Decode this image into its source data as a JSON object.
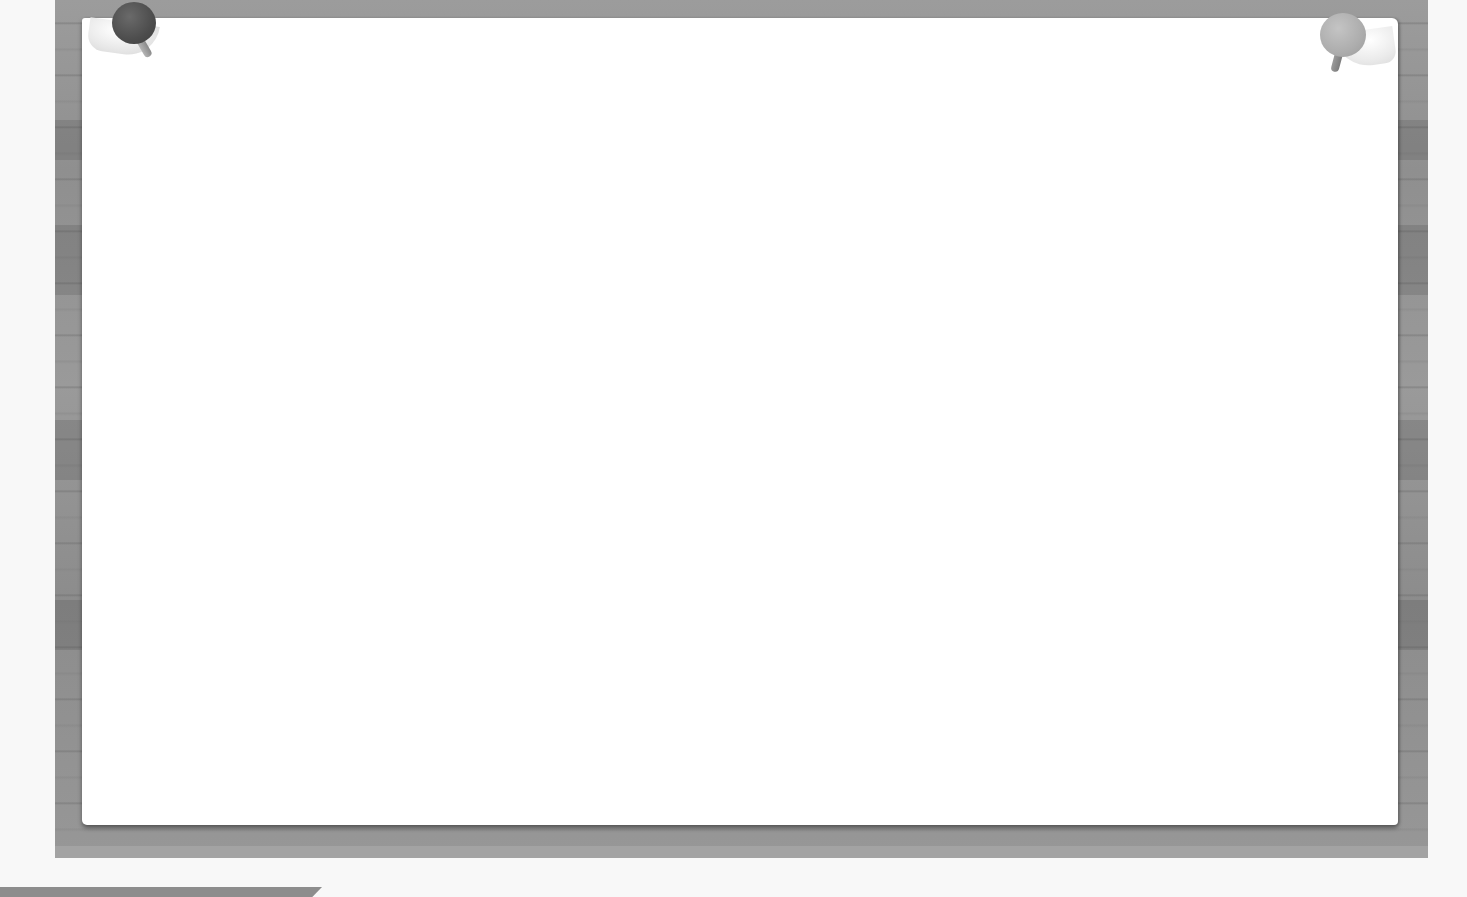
{
  "scene": {
    "type": "pinned-notice-board",
    "colors": {
      "background": "#f8f8f8",
      "board_wood": "#959595",
      "paper": "#ffffff",
      "pin_left": "#4d4d4d",
      "pin_right": "#adadad",
      "bottom_bar": "#8d8d8d"
    }
  },
  "board": {
    "paper": {
      "text": ""
    },
    "pins": [
      {
        "position": "top-left",
        "icon": "pushpin-icon",
        "color": "#4d4d4d"
      },
      {
        "position": "top-right",
        "icon": "pushpin-icon",
        "color": "#adadad"
      }
    ]
  },
  "bottom_bar": {
    "label": ""
  }
}
